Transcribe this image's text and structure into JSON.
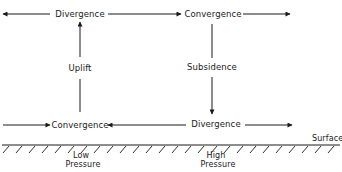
{
  "diagram": {
    "upper_level": {
      "left_label": "Divergence",
      "right_label": "Convergence"
    },
    "vertical": {
      "left_label": "Uplift",
      "right_label": "Subsidence"
    },
    "lower_level": {
      "left_label": "Convergence",
      "right_label": "Divergence"
    },
    "surface_label": "Surface",
    "low_pressure": {
      "line1": "Low",
      "line2": "Pressure"
    },
    "high_pressure": {
      "line1": "High",
      "line2": "Pressure"
    },
    "colors": {
      "ink": "#1a1a1a",
      "background": "#ffffff"
    }
  }
}
